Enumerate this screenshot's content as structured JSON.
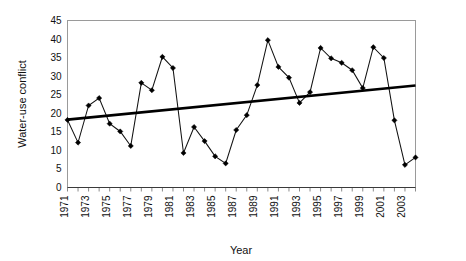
{
  "chart_data": {
    "type": "line",
    "title": "",
    "xlabel": "Year",
    "ylabel": "Water-use conflict",
    "xlim": [
      1971,
      2004
    ],
    "ylim": [
      0,
      45
    ],
    "ytick_values": [
      0,
      5,
      10,
      15,
      20,
      25,
      30,
      35,
      40,
      45
    ],
    "ytick_labels": [
      "0",
      "5",
      "10",
      "15",
      "20",
      "25",
      "30",
      "35",
      "40",
      "45"
    ],
    "xtick_values": [
      1971,
      1973,
      1975,
      1977,
      1979,
      1981,
      1983,
      1985,
      1987,
      1989,
      1991,
      1993,
      1995,
      1997,
      1999,
      2001,
      2003
    ],
    "xtick_labels": [
      "1971",
      "1973",
      "1975",
      "1977",
      "1979",
      "1981",
      "1983",
      "1985",
      "1987",
      "1989",
      "1991",
      "1993",
      "1995",
      "1997",
      "1999",
      "2001",
      "2003"
    ],
    "grid": false,
    "legend": "none",
    "x": [
      1971,
      1972,
      1973,
      1974,
      1975,
      1976,
      1977,
      1978,
      1979,
      1980,
      1981,
      1982,
      1983,
      1984,
      1985,
      1986,
      1987,
      1988,
      1989,
      1990,
      1991,
      1992,
      1993,
      1994,
      1995,
      1996,
      1997,
      1998,
      1999,
      2000,
      2001,
      2002,
      2003,
      2004
    ],
    "series": [
      {
        "name": "Water-use conflict",
        "marker": "diamond",
        "color": "#000000",
        "values": [
          18.2,
          12.1,
          22.1,
          24.1,
          17.2,
          15.1,
          11.2,
          28.2,
          26.2,
          35.2,
          32.2,
          9.3,
          16.3,
          12.5,
          8.4,
          6.5,
          15.5,
          19.5,
          27.6,
          39.7,
          32.5,
          29.6,
          22.8,
          25.7,
          37.6,
          34.8,
          33.6,
          31.6,
          26.8,
          37.8,
          34.9,
          18.1,
          6.1,
          8.1
        ]
      },
      {
        "name": "Linear trend",
        "type": "trendline",
        "color": "#000000",
        "endpoints": [
          [
            1971,
            18.3
          ],
          [
            2004,
            27.5
          ]
        ]
      }
    ]
  }
}
